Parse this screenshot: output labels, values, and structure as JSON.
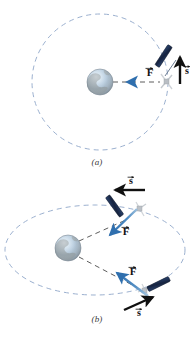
{
  "figure": {
    "background_color": "#ffffff",
    "panels": [
      {
        "id": "a",
        "caption": "(a)",
        "orbit_type": "circular",
        "orbit_color": "#9aa7c4",
        "orbit_style": "dashed",
        "earth": {
          "label": "Earth",
          "center": [
            100,
            82
          ],
          "radius": 13
        },
        "orbit": {
          "center": [
            100,
            82
          ],
          "radius": 68
        },
        "satellites": [
          {
            "name": "satellite-a",
            "position": [
              168,
              82
            ],
            "force_vector": {
              "label": "F",
              "accent": "#3a7ab8",
              "direction": "left",
              "points_to": "earth"
            },
            "velocity_vector": {
              "label": "s",
              "accent": "#111111",
              "direction": "up",
              "tangent": true
            }
          }
        ]
      },
      {
        "id": "b",
        "caption": "(b)",
        "orbit_type": "elliptical",
        "orbit_color": "#9aa7c4",
        "orbit_style": "dashed",
        "earth": {
          "label": "Earth",
          "center": [
            68,
            248
          ],
          "radius": 13
        },
        "orbit": {
          "center": [
            95,
            250
          ],
          "rx": 90,
          "ry": 45
        },
        "satellites": [
          {
            "name": "satellite-b-upper",
            "position": [
              139,
              209
            ],
            "force_vector": {
              "label": "F",
              "accent": "#3a7ab8",
              "direction": "down-left",
              "points_to": "earth"
            },
            "velocity_vector": {
              "label": "s",
              "accent": "#111111",
              "direction": "left",
              "tangent": true
            }
          },
          {
            "name": "satellite-b-lower",
            "position": [
              148,
              293
            ],
            "force_vector": {
              "label": "F",
              "accent": "#3a7ab8",
              "direction": "up-left",
              "points_to": "earth"
            },
            "velocity_vector": {
              "label": "s",
              "accent": "#111111",
              "direction": "up-right",
              "tangent": true
            }
          }
        ]
      }
    ],
    "vector_labels": {
      "force": "F",
      "displacement": "s",
      "arrow_accent": "#2f6fae",
      "arrow_dark": "#101010"
    },
    "colors": {
      "orbit_dashed": "#9bb0cf",
      "force_arrow": "#3c7cb9",
      "velocity_arrow": "#111111",
      "earth_ocean": "#aac6de",
      "earth_land": "#8e9aa0",
      "earth_outline": "#7f8c96",
      "satellite_panel": "#1d2f55",
      "satellite_body": "#c9cdd2",
      "radius_line": "#4a4a4a",
      "caption_text": "#3a3a3a"
    },
    "bottom_cropped_text": "  "
  }
}
